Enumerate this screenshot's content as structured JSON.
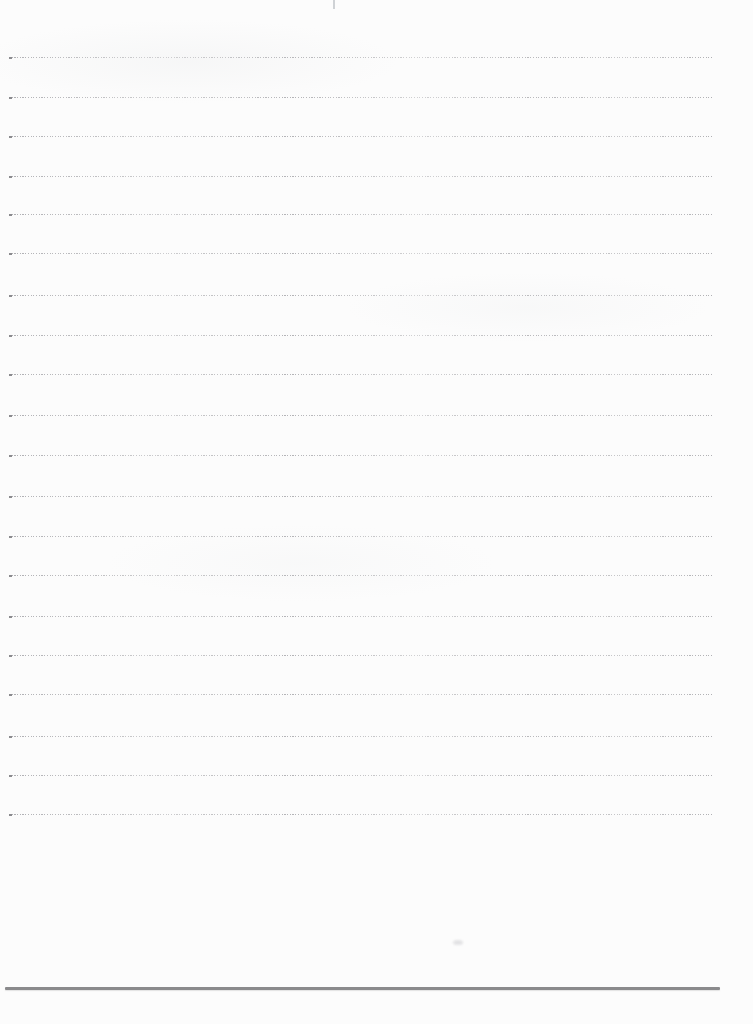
{
  "page": {
    "width": 753,
    "height": 1024,
    "background_color": "#fcfcfc",
    "content_text": ""
  },
  "ruled_lines": {
    "count": 20,
    "style": "fine-dotted",
    "color": "#8d8d92",
    "start_dot_color": "#55555a",
    "x_start": 9,
    "x_end": 713,
    "y_positions": [
      57,
      97,
      136,
      176,
      214,
      253,
      295,
      335,
      374,
      415,
      455,
      496,
      536,
      575,
      616,
      655,
      694,
      736,
      775,
      814
    ]
  },
  "footer_rule": {
    "style": "solid",
    "color": "#8a8a8c",
    "y": 987,
    "x_start": 5,
    "x_end": 720,
    "thickness": 2.5
  },
  "artifacts": {
    "top_center_tick": {
      "x": 333,
      "y": 0,
      "height": 9
    },
    "smudge": {
      "x": 453,
      "y": 940,
      "width": 10,
      "height": 5
    }
  }
}
